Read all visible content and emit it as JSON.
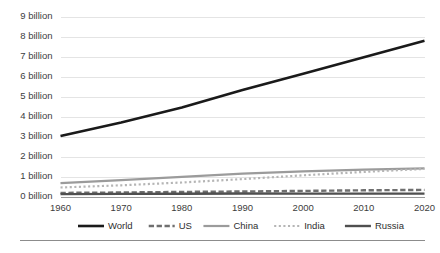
{
  "chart_data": {
    "type": "line",
    "title": "",
    "subtitle": "",
    "xlabel": "",
    "ylabel": "",
    "x": [
      1960,
      1970,
      1980,
      1990,
      2000,
      2010,
      2020
    ],
    "xlim": [
      1960,
      2020
    ],
    "ylim": [
      0,
      9
    ],
    "y_tick_values": [
      9,
      8,
      7,
      6,
      5,
      4,
      3,
      2,
      1,
      0
    ],
    "y_tick_labels": [
      "9 billion",
      "8 billion",
      "7 billion",
      "6 billion",
      "5 billion",
      "4 billion",
      "3 billion",
      "2 billion",
      "1 billion",
      "0 billion"
    ],
    "x_tick_labels": [
      "1960",
      "1970",
      "1980",
      "1990",
      "2000",
      "2010",
      "2020"
    ],
    "grid": true,
    "grid_axis": "y",
    "legend_position": "bottom",
    "units": "billions of people",
    "series": [
      {
        "name": "World",
        "style": "solid",
        "color": "#1a1a1a",
        "width": 2.6,
        "values": [
          3.03,
          3.7,
          4.45,
          5.33,
          6.14,
          6.96,
          7.79
        ]
      },
      {
        "name": "US",
        "style": "dashed",
        "color": "#6f6f6f",
        "width": 2.4,
        "values": [
          0.18,
          0.2,
          0.23,
          0.25,
          0.28,
          0.31,
          0.33
        ]
      },
      {
        "name": "China",
        "style": "solid",
        "color": "#9b9b9b",
        "width": 2.2,
        "values": [
          0.67,
          0.82,
          0.98,
          1.14,
          1.26,
          1.34,
          1.41
        ]
      },
      {
        "name": "India",
        "style": "dotted",
        "color": "#b5b5b5",
        "width": 2.2,
        "values": [
          0.45,
          0.56,
          0.7,
          0.87,
          1.06,
          1.23,
          1.38
        ]
      },
      {
        "name": "Russia",
        "style": "solid",
        "color": "#4f4f4f",
        "width": 2.4,
        "values": [
          0.12,
          0.13,
          0.14,
          0.148,
          0.146,
          0.143,
          0.144
        ]
      }
    ]
  },
  "legend": {
    "items": [
      {
        "label": "World"
      },
      {
        "label": "US"
      },
      {
        "label": "China"
      },
      {
        "label": "India"
      },
      {
        "label": "Russia"
      }
    ]
  }
}
